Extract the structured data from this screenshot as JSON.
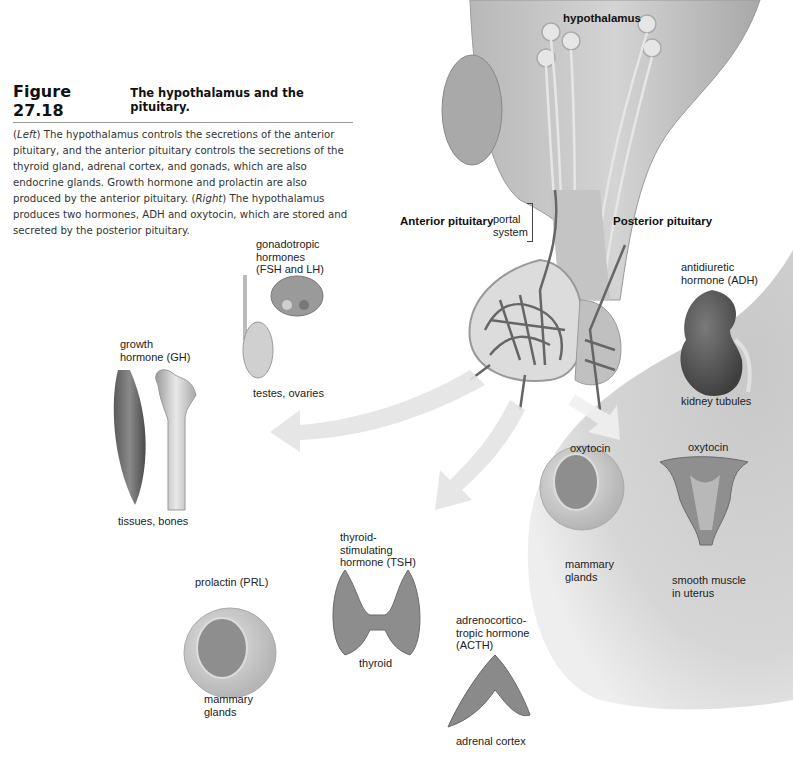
{
  "figure": {
    "number": "Figure 27.18",
    "title": "The hypothalamus and the pituitary.",
    "caption": {
      "left_tag": "Left",
      "left_text": " The hypothalamus controls the secretions of the anterior pituitary, and the anterior pituitary controls the secretions of the thyroid gland, adrenal cortex, and gonads, which are also endocrine glands. Growth hormone and prolactin are also produced by the anterior pituitary.",
      "right_tag": "Right",
      "right_text": " The hypothalamus produces two hormones, ADH and oxytocin, which are stored and secreted by the posterior pituitary."
    }
  },
  "labels": {
    "hypothalamus": "hypothalamus",
    "anterior_pituitary": "Anterior pituitary",
    "posterior_pituitary": "Posterior pituitary",
    "portal_system": "portal\nsystem",
    "gonadotropic": "gonadotropic\nhormones\n(FSH and LH)",
    "testes_ovaries": "testes, ovaries",
    "growth_hormone": "growth\nhormone (GH)",
    "tissues_bones": "tissues, bones",
    "tsh": "thyroid-\nstimulating\nhormone (TSH)",
    "thyroid": "thyroid",
    "prolactin": "prolactin (PRL)",
    "mammary_glands_prl": "mammary\nglands",
    "acth": "adrenocortico-\ntropic hormone\n(ACTH)",
    "adrenal_cortex": "adrenal cortex",
    "adh": "antidiuretic\nhormone (ADH)",
    "kidney_tubules": "kidney tubules",
    "oxytocin_mammary": "oxytocin",
    "mammary_glands_oxy": "mammary\nglands",
    "oxytocin_uterus": "oxytocin",
    "smooth_muscle": "smooth muscle\nin uterus"
  }
}
